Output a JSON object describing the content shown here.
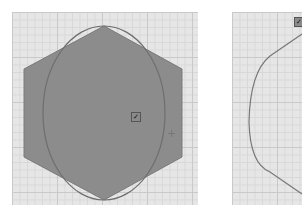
{
  "panels": [
    {
      "id": "left",
      "shapes": {
        "hexagon": {
          "fill": "#8c8c8c",
          "stroke": "#7a7a7a"
        },
        "ellipse": {
          "stroke": "#6e6e6e"
        }
      },
      "handle_glyph": "✓",
      "icons": [
        "checkbox-handle-icon",
        "crosshair-icon"
      ]
    },
    {
      "id": "right",
      "shapes": {
        "outline": {
          "stroke": "#777777"
        }
      },
      "handle_glyph": "✓",
      "icons": [
        "checkbox-handle-icon"
      ]
    }
  ],
  "colors": {
    "canvas_bg": "#e6e6e6",
    "grid_major": "#c9c9c9",
    "grid_minor": "#d8d8d8",
    "page_bg": "#ffffff"
  }
}
